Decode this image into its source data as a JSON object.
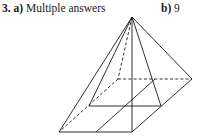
{
  "question": {
    "number": "3.",
    "part_a_label": "a)",
    "part_a_answer": "Multiple answers",
    "part_b_label": "b)",
    "part_b_answer": "9"
  },
  "figure": {
    "stroke_color": "#1a1a1a",
    "solid_edges": [
      [
        132,
        17,
        59,
        132
      ],
      [
        132,
        17,
        89,
        106
      ],
      [
        132,
        17,
        132,
        132
      ],
      [
        132,
        17,
        161,
        106
      ],
      [
        132,
        17,
        192,
        79
      ],
      [
        59,
        132,
        132,
        132
      ],
      [
        132,
        132,
        192,
        79
      ],
      [
        89,
        106,
        161,
        106
      ],
      [
        96,
        132,
        155,
        79
      ]
    ],
    "dashed_edges": [
      [
        132,
        17,
        118,
        79
      ],
      [
        118,
        79,
        192,
        79
      ],
      [
        118,
        79,
        59,
        132
      ]
    ]
  }
}
